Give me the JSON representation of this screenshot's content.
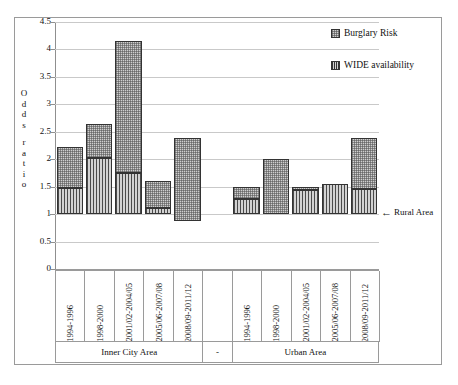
{
  "chart_data": {
    "type": "bar",
    "title": "",
    "xlabel": "",
    "ylabel": "Odds ratio",
    "ylim": [
      0,
      4.5
    ],
    "ytick_labels": [
      "0",
      "0.5",
      "1",
      "1.5",
      "2",
      "2.5",
      "3",
      "3.5",
      "4",
      "4.5"
    ],
    "ytick_values": [
      0,
      0.5,
      1,
      1.5,
      2,
      2.5,
      3,
      3.5,
      4,
      4.5
    ],
    "grid": true,
    "legend_position": "top-right",
    "legend": [
      "Burglary Risk",
      "WIDE availability"
    ],
    "baseline_value": 1,
    "baseline_annotation": "Rural Area",
    "baseline_arrow": "←",
    "categories": [
      "1994-1996",
      "1998-2000",
      "2001/02-2004/05",
      "2005/06-2007/08",
      "2008/09-2011/12"
    ],
    "groups": [
      {
        "name": "Inner City Area",
        "bars": [
          {
            "category": "1994-1996",
            "burglary_top": 2.23,
            "wide_top": 1.48,
            "bar_bottom": 1.0
          },
          {
            "category": "1998-2000",
            "burglary_top": 2.65,
            "wide_top": 2.03,
            "bar_bottom": 1.0
          },
          {
            "category": "2001/02-2004/05",
            "burglary_top": 4.15,
            "wide_top": 1.75,
            "bar_bottom": 1.0
          },
          {
            "category": "2005/06-2007/08",
            "burglary_top": 1.6,
            "wide_top": 1.11,
            "bar_bottom": 1.0
          },
          {
            "category": "2008/09-2011/12",
            "burglary_top": 2.39,
            "wide_top": 0.88,
            "bar_bottom": 0.88
          }
        ]
      },
      {
        "name": "Urban Area",
        "bars": [
          {
            "category": "1994-1996",
            "burglary_top": 1.5,
            "wide_top": 1.28,
            "bar_bottom": 1.0
          },
          {
            "category": "1998-2000",
            "burglary_top": 2.0,
            "wide_top": 1.0,
            "bar_bottom": 1.0
          },
          {
            "category": "2001/02-2004/05",
            "burglary_top": 1.5,
            "wide_top": 1.43,
            "bar_bottom": 1.0
          },
          {
            "category": "2005/06-2007/08",
            "burglary_top": 1.55,
            "wide_top": 1.55,
            "bar_bottom": 1.0
          },
          {
            "category": "2008/09-2011/12",
            "burglary_top": 2.39,
            "wide_top": 1.45,
            "bar_bottom": 1.0
          }
        ]
      }
    ],
    "group_separator_label": "-"
  },
  "yaxis": {
    "label_letters": [
      "O",
      "d",
      "d",
      "s",
      "",
      "r",
      "a",
      "t",
      "i",
      "o"
    ]
  }
}
